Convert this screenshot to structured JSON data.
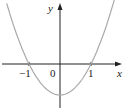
{
  "chart_data": {
    "type": "line",
    "title": "",
    "function": "y = x^2 - 1",
    "xlabel": "x",
    "ylabel": "y",
    "tick_labels": [
      "-1",
      "0",
      "1"
    ],
    "x": [
      -1.7,
      -1.5,
      -1.25,
      -1,
      -0.75,
      -0.5,
      -0.25,
      0,
      0.25,
      0.5,
      0.75,
      1,
      1.25,
      1.5,
      1.75
    ],
    "values": [
      1.89,
      1.25,
      0.5625,
      0,
      -0.4375,
      -0.75,
      -0.9375,
      -1,
      -0.9375,
      -0.75,
      -0.4375,
      0,
      0.5625,
      1.25,
      2.0625
    ],
    "xlim": [
      -1.9,
      2.0
    ],
    "ylim": [
      -1.2,
      2.0
    ],
    "grid": false,
    "legend": "none",
    "curve_color": "#aaaaaa",
    "axis_color": "#222222"
  },
  "labels": {
    "x_axis": "x",
    "y_axis": "y",
    "tick_neg1": "−1",
    "origin": "0",
    "tick_1": "1"
  }
}
